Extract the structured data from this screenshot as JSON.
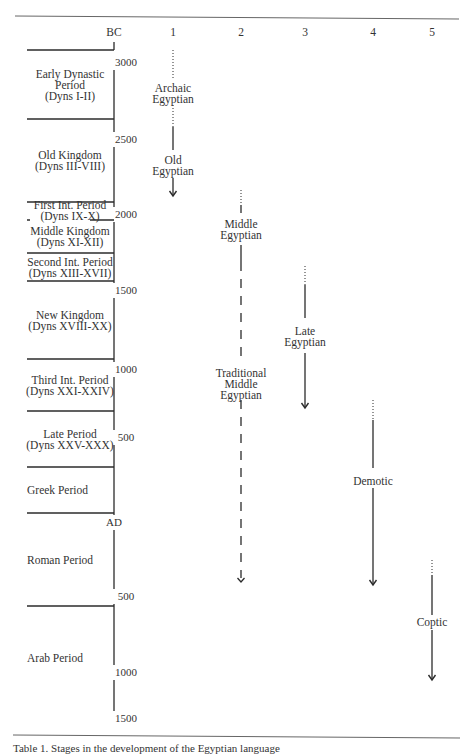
{
  "diagram": {
    "title_caption": "Table 1. Stages in the development of the Egyptian language",
    "axis": {
      "header": "BC",
      "x": 114,
      "ticks": [
        {
          "label": "3000",
          "y": 62
        },
        {
          "label": "2500",
          "y": 139
        },
        {
          "label": "2000",
          "y": 214
        },
        {
          "label": "1500",
          "y": 290
        },
        {
          "label": "1000",
          "y": 369
        },
        {
          "label": "500",
          "y": 437
        },
        {
          "label": "AD",
          "y": 522
        },
        {
          "label": "500",
          "y": 596
        },
        {
          "label": "1000",
          "y": 672
        },
        {
          "label": "1500",
          "y": 718
        }
      ]
    },
    "column_headers": [
      {
        "label": "1",
        "x": 173
      },
      {
        "label": "2",
        "x": 241
      },
      {
        "label": "3",
        "x": 305
      },
      {
        "label": "4",
        "x": 373
      },
      {
        "label": "5",
        "x": 432
      }
    ],
    "periods": [
      {
        "lines": [
          "Early Dynastic",
          "Period",
          "(Dyns I-II)"
        ],
        "top": 50,
        "bottom": 119,
        "center": true
      },
      {
        "lines": [
          "Old Kingdom",
          "(Dyns III-VIII)"
        ],
        "top": 119,
        "bottom": 202,
        "center": true
      },
      {
        "lines": [
          "First Int. Period",
          "(Dyns IX-X)"
        ],
        "top": 202,
        "bottom": 220,
        "center": true
      },
      {
        "lines": [
          "Middle Kingdom",
          "(Dyns XI-XII)"
        ],
        "top": 220,
        "bottom": 253,
        "center": true
      },
      {
        "lines": [
          "Second Int. Period",
          "(Dyns XIII-XVII)"
        ],
        "top": 253,
        "bottom": 281,
        "center": true
      },
      {
        "lines": [
          "New Kingdom",
          "(Dyns XVIII-XX)"
        ],
        "top": 281,
        "bottom": 359,
        "center": true
      },
      {
        "lines": [
          "Third Int. Period",
          "(Dyns XXI-XXIV)"
        ],
        "top": 359,
        "bottom": 411,
        "center": true
      },
      {
        "lines": [
          "Late Period",
          "(Dyns XXV-XXX)"
        ],
        "top": 411,
        "bottom": 467,
        "center": true
      },
      {
        "lines": [
          "Greek Period"
        ],
        "top": 467,
        "bottom": 513,
        "center": false
      },
      {
        "lines": [
          "Roman Period"
        ],
        "top": 513,
        "bottom": 606,
        "center": false
      },
      {
        "lines": [
          "Arab Period"
        ],
        "top": 606,
        "bottom": 710,
        "center": false
      }
    ],
    "stages": [
      {
        "name": "Archaic Egyptian",
        "column": "1",
        "lines": [
          "Archaic",
          "Egyptian"
        ],
        "x": 173,
        "segments": [
          {
            "style": "dotted",
            "y1": 50,
            "y2": 78
          }
        ],
        "label_y": 88
      },
      {
        "name": "Old Egyptian",
        "column": "1",
        "lines": [
          "Old",
          "Egyptian"
        ],
        "x": 173,
        "segments": [
          {
            "style": "dotted",
            "y1": 105,
            "y2": 127
          },
          {
            "style": "solid",
            "y1": 127,
            "y2": 150
          },
          {
            "style": "solid",
            "y1": 178,
            "y2": 196
          }
        ],
        "label_y": 160,
        "arrow_y": 196,
        "arrow": "solid"
      },
      {
        "name": "Middle Egyptian",
        "column": "2",
        "lines": [
          "Middle",
          "Egyptian"
        ],
        "x": 241,
        "segments": [
          {
            "style": "dotted",
            "y1": 190,
            "y2": 205
          },
          {
            "style": "solid",
            "y1": 205,
            "y2": 213
          },
          {
            "style": "solid",
            "y1": 245,
            "y2": 262
          },
          {
            "style": "dashed",
            "y1": 262,
            "y2": 360
          }
        ],
        "label_y": 224
      },
      {
        "name": "Traditional Middle Egyptian",
        "column": "2",
        "lines": [
          "Traditional",
          "Middle",
          "Egyptian"
        ],
        "x": 241,
        "segments": [
          {
            "style": "dashed",
            "y1": 400,
            "y2": 578
          }
        ],
        "label_y": 373,
        "arrow_y": 582,
        "arrow": "open"
      },
      {
        "name": "Late Egyptian",
        "column": "3",
        "lines": [
          "Late",
          "Egyptian"
        ],
        "x": 305,
        "segments": [
          {
            "style": "dotted",
            "y1": 266,
            "y2": 285
          },
          {
            "style": "solid",
            "y1": 285,
            "y2": 318
          },
          {
            "style": "solid",
            "y1": 353,
            "y2": 407
          }
        ],
        "label_y": 331,
        "arrow_y": 408,
        "arrow": "solid"
      },
      {
        "name": "Demotic",
        "column": "4",
        "lines": [
          "Demotic"
        ],
        "x": 373,
        "segments": [
          {
            "style": "dotted",
            "y1": 400,
            "y2": 420
          },
          {
            "style": "solid",
            "y1": 420,
            "y2": 468
          },
          {
            "style": "solid",
            "y1": 488,
            "y2": 584
          }
        ],
        "label_y": 481,
        "arrow_y": 585,
        "arrow": "solid"
      },
      {
        "name": "Coptic",
        "column": "5",
        "lines": [
          "Coptic"
        ],
        "x": 432,
        "segments": [
          {
            "style": "dotted",
            "y1": 560,
            "y2": 575
          },
          {
            "style": "solid",
            "y1": 575,
            "y2": 615
          },
          {
            "style": "solid",
            "y1": 630,
            "y2": 679
          }
        ],
        "label_y": 622,
        "arrow_y": 680,
        "arrow": "solid"
      }
    ],
    "colors": {
      "ink": "#2b2b2b",
      "rule": "#555555",
      "background": "#ffffff"
    }
  }
}
